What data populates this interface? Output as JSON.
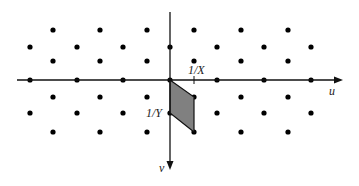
{
  "diagram": {
    "axes": {
      "horizontal": {
        "label": "u",
        "y": 80,
        "x_start": 17,
        "x_end": 343
      },
      "vertical": {
        "label": "v",
        "x": 170,
        "y_start": 12,
        "y_end": 170
      }
    },
    "labels": {
      "x_tick": "1/X",
      "y_tick": "1/Y",
      "u_axis": "u",
      "v_axis": "v"
    },
    "parallelogram": {
      "points": [
        [
          170,
          80
        ],
        [
          194,
          97
        ],
        [
          194,
          132
        ],
        [
          170,
          113
        ]
      ],
      "fill": "#808080",
      "stroke": "#111111"
    },
    "lattice_rows": [
      {
        "y": 30,
        "xs": [
          53,
          100,
          147,
          194,
          241,
          288
        ]
      },
      {
        "y": 47,
        "xs": [
          30,
          77,
          123,
          170,
          217,
          264,
          311
        ]
      },
      {
        "y": 61,
        "xs": [
          53,
          100,
          147,
          194,
          241,
          288
        ]
      },
      {
        "y": 80,
        "xs": [
          30,
          77,
          123,
          170,
          217,
          264,
          311
        ]
      },
      {
        "y": 97,
        "xs": [
          53,
          100,
          147,
          194,
          241,
          288
        ]
      },
      {
        "y": 113,
        "xs": [
          30,
          77,
          123,
          170,
          217,
          264,
          311
        ]
      },
      {
        "y": 132,
        "xs": [
          53,
          100,
          147,
          194,
          241,
          288
        ]
      }
    ],
    "colors": {
      "dot": "#000000",
      "axis": "#111111"
    }
  }
}
